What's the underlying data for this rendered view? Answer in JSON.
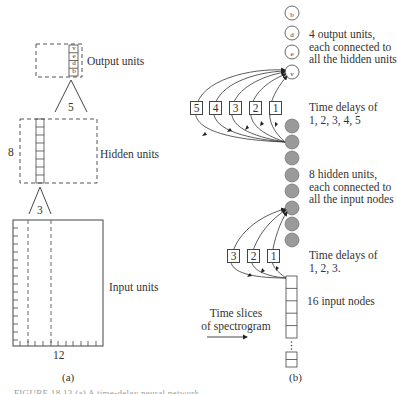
{
  "panel_a": {
    "output_label": "Output units",
    "output_cells": [
      "v",
      "e",
      "d",
      "b"
    ],
    "hidden_label": "Hidden units",
    "hidden_count": "8",
    "hidden_window": "5",
    "input_window": "3",
    "input_label": "Input units",
    "input_width": "12",
    "caption": "(a)"
  },
  "panel_b": {
    "output_nodes": [
      "b",
      "d",
      "e",
      "v"
    ],
    "output_desc": [
      "4 output units,",
      "each connected to",
      "all the hidden units"
    ],
    "hidden_delays": [
      "5",
      "4",
      "3",
      "2",
      "1"
    ],
    "hidden_delay_desc": [
      "Time delays of",
      "1, 2, 3, 4, 5"
    ],
    "hidden_desc": [
      "8 hidden units,",
      "each connected to",
      "all the input nodes"
    ],
    "input_delays": [
      "3",
      "2",
      "1"
    ],
    "input_delay_desc": [
      "Time delays of",
      "1, 2, 3."
    ],
    "input_desc": "16 input nodes",
    "time_slices": [
      "Time slices",
      "of spectrogram"
    ],
    "caption": "(b)"
  },
  "figure_caption": "FIGURE 18.13 (a) A time-delay neural network"
}
